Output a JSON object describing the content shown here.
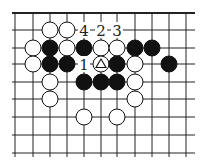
{
  "diagram": {
    "type": "go-board",
    "grid": {
      "cols": 11,
      "rows": 9,
      "x": [
        15,
        33,
        50,
        67,
        84,
        101,
        117,
        135,
        152,
        169,
        186
      ],
      "y": [
        13,
        30,
        48,
        64,
        82,
        99,
        117,
        135,
        153
      ],
      "top_edge": true
    },
    "colors": {
      "black": "#111111",
      "white": "#ffffff",
      "line": "#222222"
    },
    "stones": [
      {
        "c": 2,
        "r": 1,
        "color": "white"
      },
      {
        "c": 3,
        "r": 1,
        "color": "white"
      },
      {
        "c": 1,
        "r": 2,
        "color": "white"
      },
      {
        "c": 2,
        "r": 2,
        "color": "black"
      },
      {
        "c": 3,
        "r": 2,
        "color": "white"
      },
      {
        "c": 4,
        "r": 2,
        "color": "black"
      },
      {
        "c": 5,
        "r": 2,
        "color": "white"
      },
      {
        "c": 6,
        "r": 2,
        "color": "white"
      },
      {
        "c": 7,
        "r": 2,
        "color": "black"
      },
      {
        "c": 8,
        "r": 2,
        "color": "black"
      },
      {
        "c": 1,
        "r": 3,
        "color": "white"
      },
      {
        "c": 2,
        "r": 3,
        "color": "black"
      },
      {
        "c": 3,
        "r": 3,
        "color": "black"
      },
      {
        "c": 5,
        "r": 3,
        "color": "white",
        "mark": "triangle"
      },
      {
        "c": 6,
        "r": 3,
        "color": "black"
      },
      {
        "c": 7,
        "r": 3,
        "color": "white"
      },
      {
        "c": 9,
        "r": 3,
        "color": "black"
      },
      {
        "c": 2,
        "r": 4,
        "color": "white"
      },
      {
        "c": 4,
        "r": 4,
        "color": "black"
      },
      {
        "c": 5,
        "r": 4,
        "color": "black"
      },
      {
        "c": 6,
        "r": 4,
        "color": "black"
      },
      {
        "c": 7,
        "r": 4,
        "color": "white"
      },
      {
        "c": 2,
        "r": 5,
        "color": "white"
      },
      {
        "c": 7,
        "r": 5,
        "color": "white"
      },
      {
        "c": 4,
        "r": 6,
        "color": "white"
      },
      {
        "c": 6,
        "r": 6,
        "color": "white"
      }
    ],
    "labels": [
      {
        "c": 4,
        "r": 1,
        "text": "4"
      },
      {
        "c": 5,
        "r": 1,
        "text": "2"
      },
      {
        "c": 6,
        "r": 1,
        "text": "3"
      },
      {
        "c": 4,
        "r": 3,
        "text": "1"
      }
    ]
  }
}
